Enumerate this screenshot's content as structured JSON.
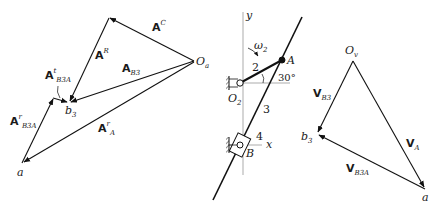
{
  "accel_polygon": {
    "origin": "O",
    "origin_sub": "a",
    "vectors": [
      {
        "base": "A",
        "sup": "C",
        "sub": ""
      },
      {
        "base": "A",
        "sup": "R",
        "sub": ""
      },
      {
        "base": "A",
        "sup": "",
        "sub": "B3"
      },
      {
        "base": "A",
        "sup": "t",
        "sub": "B3A"
      },
      {
        "base": "A",
        "sup": "r",
        "sub": "B3A"
      },
      {
        "base": "A",
        "sup": "r",
        "sub": "A"
      }
    ],
    "points": {
      "b3": "b",
      "b3_sub": "3",
      "a": "a"
    }
  },
  "mechanism": {
    "axis_y": "y",
    "axis_x": "x",
    "omega": "ω",
    "omega_sub": "2",
    "link2": "2",
    "link3": "3",
    "link4": "4",
    "angle": "30°",
    "pivot": "O",
    "pivot_sub": "2",
    "point_A": "A",
    "point_B": "B"
  },
  "velocity_polygon": {
    "origin": "O",
    "origin_sub": "v",
    "vectors": [
      {
        "base": "V",
        "sub": "B3"
      },
      {
        "base": "V",
        "sub": "A"
      },
      {
        "base": "V",
        "sub": "B3A"
      }
    ],
    "points": {
      "b3": "b",
      "b3_sub": "3",
      "a": "a"
    }
  }
}
